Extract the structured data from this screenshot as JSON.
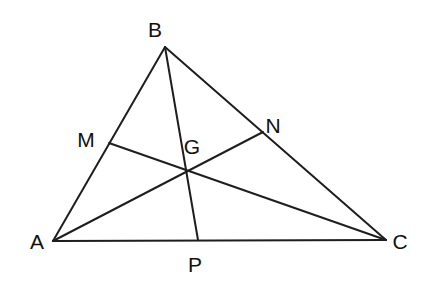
{
  "diagram": {
    "type": "triangle-medians-centroid",
    "stroke_color": "#1e1e1e",
    "label_color": "#111111",
    "points": {
      "A": {
        "x": 53,
        "y": 241,
        "label": "A",
        "lx": 37,
        "ly": 249,
        "anchor": "middle"
      },
      "B": {
        "x": 165,
        "y": 47,
        "label": "B",
        "lx": 155,
        "ly": 37,
        "anchor": "middle"
      },
      "C": {
        "x": 386,
        "y": 240,
        "label": "C",
        "lx": 400,
        "ly": 249,
        "anchor": "middle"
      },
      "M": {
        "x": 109,
        "y": 143,
        "label": "M",
        "lx": 86,
        "ly": 147,
        "anchor": "middle"
      },
      "N": {
        "x": 263,
        "y": 132,
        "label": "N",
        "lx": 273,
        "ly": 133,
        "anchor": "middle"
      },
      "G": {
        "x": 186,
        "y": 170,
        "label": "G",
        "lx": 192,
        "ly": 154,
        "anchor": "middle"
      },
      "P": {
        "x": 198,
        "y": 240,
        "label": "P",
        "lx": 195,
        "ly": 272,
        "anchor": "middle"
      }
    },
    "segments": [
      {
        "name": "side-ab",
        "from": "A",
        "to": "B"
      },
      {
        "name": "side-bc",
        "from": "B",
        "to": "C"
      },
      {
        "name": "side-ca",
        "from": "C",
        "to": "A"
      },
      {
        "name": "median-bp",
        "from": "B",
        "to": "P"
      },
      {
        "name": "median-an",
        "from": "A",
        "to": "N"
      },
      {
        "name": "median-cm",
        "from": "C",
        "to": "M"
      }
    ]
  }
}
